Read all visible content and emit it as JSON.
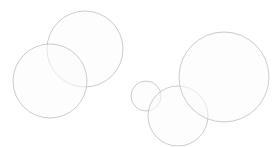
{
  "canvas": {
    "width": 276,
    "height": 147,
    "background_color": "#ffffff",
    "title": "",
    "labels": []
  },
  "style": {
    "fill_color": "#fbfbfb",
    "fill_opacity": 0.55,
    "stroke_color": "#a8a8a8",
    "stroke_opacity": 0.65,
    "stroke_width": 0.9,
    "blur_radius": 0.7
  },
  "chart_data": {
    "type": "scatter",
    "title": "",
    "subtitle": "",
    "xlabel": "",
    "ylabel": "",
    "grid": false,
    "legend": "none",
    "xlim": [
      0,
      276
    ],
    "ylim": [
      0,
      147
    ],
    "clusters": [
      {
        "name": "left-cluster",
        "circle_count": 2
      },
      {
        "name": "right-cluster",
        "circle_count": 3
      }
    ],
    "circles": [
      {
        "id": "circle-left-upper",
        "cluster": "left-cluster",
        "cx": 85,
        "cy": 49,
        "r": 38,
        "fill": "#fbfbfb",
        "stroke": "#a8a8a8"
      },
      {
        "id": "circle-left-lower",
        "cluster": "left-cluster",
        "cx": 50,
        "cy": 81,
        "r": 37,
        "fill": "#fbfbfb",
        "stroke": "#a8a8a8"
      },
      {
        "id": "circle-right-small",
        "cluster": "right-cluster",
        "cx": 146,
        "cy": 96,
        "r": 15,
        "fill": "#fbfbfb",
        "stroke": "#a8a8a8"
      },
      {
        "id": "circle-right-medium",
        "cluster": "right-cluster",
        "cx": 178,
        "cy": 116,
        "r": 30,
        "fill": "#fbfbfb",
        "stroke": "#a8a8a8"
      },
      {
        "id": "circle-right-large",
        "cluster": "right-cluster",
        "cx": 224,
        "cy": 77,
        "r": 45,
        "fill": "#fbfbfb",
        "stroke": "#a8a8a8"
      }
    ]
  }
}
